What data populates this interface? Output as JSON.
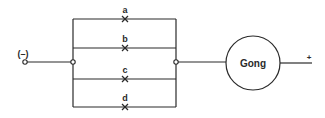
{
  "diagram": {
    "type": "circuit",
    "terminals": {
      "negative": {
        "label": "(–)"
      },
      "positive": {
        "label": "+"
      }
    },
    "switches": [
      {
        "id": "a",
        "label": "a"
      },
      {
        "id": "b",
        "label": "b"
      },
      {
        "id": "c",
        "label": "c"
      },
      {
        "id": "d",
        "label": "d"
      }
    ],
    "load": {
      "label": "Gong"
    },
    "connection": "switches a, b, c, d in parallel, in series with Gong between (–) and +"
  },
  "colors": {
    "line": "#2a2a2a",
    "background": "#ffffff"
  }
}
